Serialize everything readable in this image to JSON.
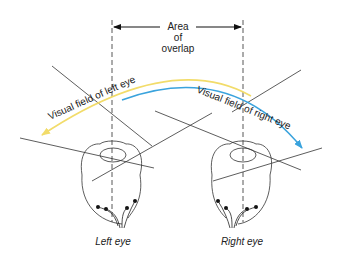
{
  "diagram": {
    "overlap_label": {
      "line1": "Area",
      "line2": "of",
      "line3": "overlap"
    },
    "field_labels": {
      "left": "Visual field of left eye",
      "right": "Visual field of right eye"
    },
    "eye_labels": {
      "left": "Left eye",
      "right": "Right eye"
    },
    "colors": {
      "left_field_arc": "#f2dc6a",
      "right_field_arc": "#3aa3dd",
      "lines": "#333333",
      "dashed": "#444444"
    }
  }
}
